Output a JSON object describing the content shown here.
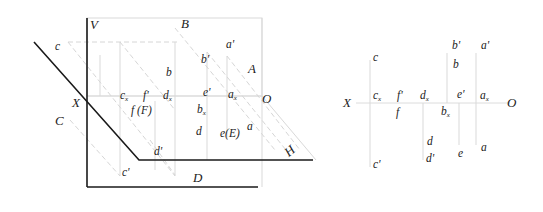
{
  "left_diagram": {
    "planes": {
      "V": "V",
      "H": "H"
    },
    "axis": {
      "X": "X",
      "O": "O"
    },
    "points_space": [
      "A",
      "B",
      "C",
      "D"
    ],
    "labels": {
      "c": "c",
      "C": "C",
      "X": "X",
      "V": "V",
      "B": "B",
      "bp": "b'",
      "ap": "a'",
      "A": "A",
      "b": "b",
      "cx": "c",
      "fp": "f'",
      "dx": "d",
      "ep": "e'",
      "ax": "a",
      "O": "O",
      "fF": "f (F)",
      "bx": "b",
      "d": "d",
      "eE": "e(E)",
      "a": "a",
      "dp": "d'",
      "H": "H",
      "cp": "c'",
      "D": "D",
      "sub_x": "x"
    }
  },
  "right_diagram": {
    "axis": {
      "X": "X",
      "O": "O"
    },
    "labels": {
      "bp": "b'",
      "ap": "a'",
      "c": "c",
      "b": "b",
      "X": "X",
      "cx": "c",
      "fp": "f'",
      "dx": "d",
      "ep": "e'",
      "ax": "a",
      "O": "O",
      "f": "f",
      "bx": "b",
      "d": "d",
      "e": "e",
      "a": "a",
      "dp": "d'",
      "cp": "c'",
      "sub_x": "x"
    }
  }
}
